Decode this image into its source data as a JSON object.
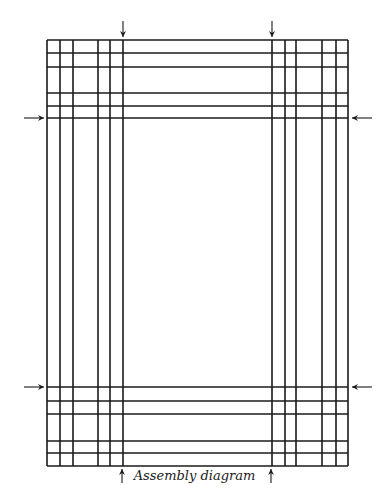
{
  "diagram": {
    "title": "Assembly diagram",
    "stroke_color": "#1a1a1a",
    "background": "#ffffff",
    "frame": {
      "left": 47,
      "top": 40,
      "right": 348,
      "bottom": 466
    },
    "vertical_lines_x": [
      47,
      60,
      73,
      98,
      110,
      123,
      272,
      285,
      296,
      322,
      336,
      348
    ],
    "horizontal_lines_y": [
      40,
      53,
      67,
      93,
      106,
      118,
      387,
      401,
      414,
      441,
      453,
      466
    ],
    "arrows": [
      {
        "name": "arrow-top-left",
        "direction": "down",
        "x": 123,
        "y1": 21,
        "y2": 37
      },
      {
        "name": "arrow-top-right",
        "direction": "down",
        "x": 272,
        "y1": 21,
        "y2": 37
      },
      {
        "name": "arrow-left-upper",
        "direction": "right",
        "y": 118,
        "x1": 24,
        "x2": 44
      },
      {
        "name": "arrow-right-upper",
        "direction": "left",
        "y": 118,
        "x1": 372,
        "x2": 352
      },
      {
        "name": "arrow-left-lower",
        "direction": "right",
        "y": 387,
        "x1": 24,
        "x2": 44
      },
      {
        "name": "arrow-right-lower",
        "direction": "left",
        "y": 387,
        "x1": 372,
        "x2": 352
      },
      {
        "name": "arrow-bottom-left",
        "direction": "up",
        "x": 122,
        "y1": 483,
        "y2": 469
      },
      {
        "name": "arrow-bottom-right",
        "direction": "up",
        "x": 271,
        "y1": 483,
        "y2": 469
      }
    ]
  }
}
